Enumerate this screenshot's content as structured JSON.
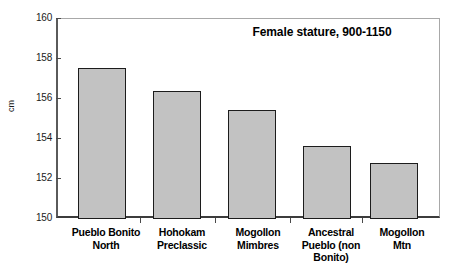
{
  "chart_data": {
    "type": "bar",
    "title": "Female stature, 900-1150",
    "xlabel": "",
    "ylabel": "cm",
    "ylim": [
      150,
      160
    ],
    "yticks": [
      150,
      152,
      154,
      156,
      158,
      160
    ],
    "grid": false,
    "legend": false,
    "categories": [
      "Pueblo Bonito North",
      "Hohokam Preclassic",
      "Mogollon Mimbres",
      "Ancestral Pueblo (non Bonito)",
      "Mogollon Mtn"
    ],
    "category_lines": [
      [
        "Pueblo Bonito",
        "North"
      ],
      [
        "Hohokam",
        "Preclassic"
      ],
      [
        "Mogollon",
        "Mimbres"
      ],
      [
        "Ancestral",
        "Pueblo (non",
        "Bonito)"
      ],
      [
        "Mogollon",
        "Mtn"
      ]
    ],
    "values": [
      157.5,
      156.35,
      155.4,
      153.6,
      152.75
    ],
    "bar_fill_color": "#c2c2c2",
    "bar_border_color": "#1c1c1c",
    "axis_color": "#3c3c3c"
  },
  "axis": {
    "y_tick_labels": [
      "160",
      "158",
      "156",
      "154",
      "152",
      "150"
    ],
    "y_title": "cm"
  },
  "title": {
    "text": "Female stature, 900-1150"
  }
}
